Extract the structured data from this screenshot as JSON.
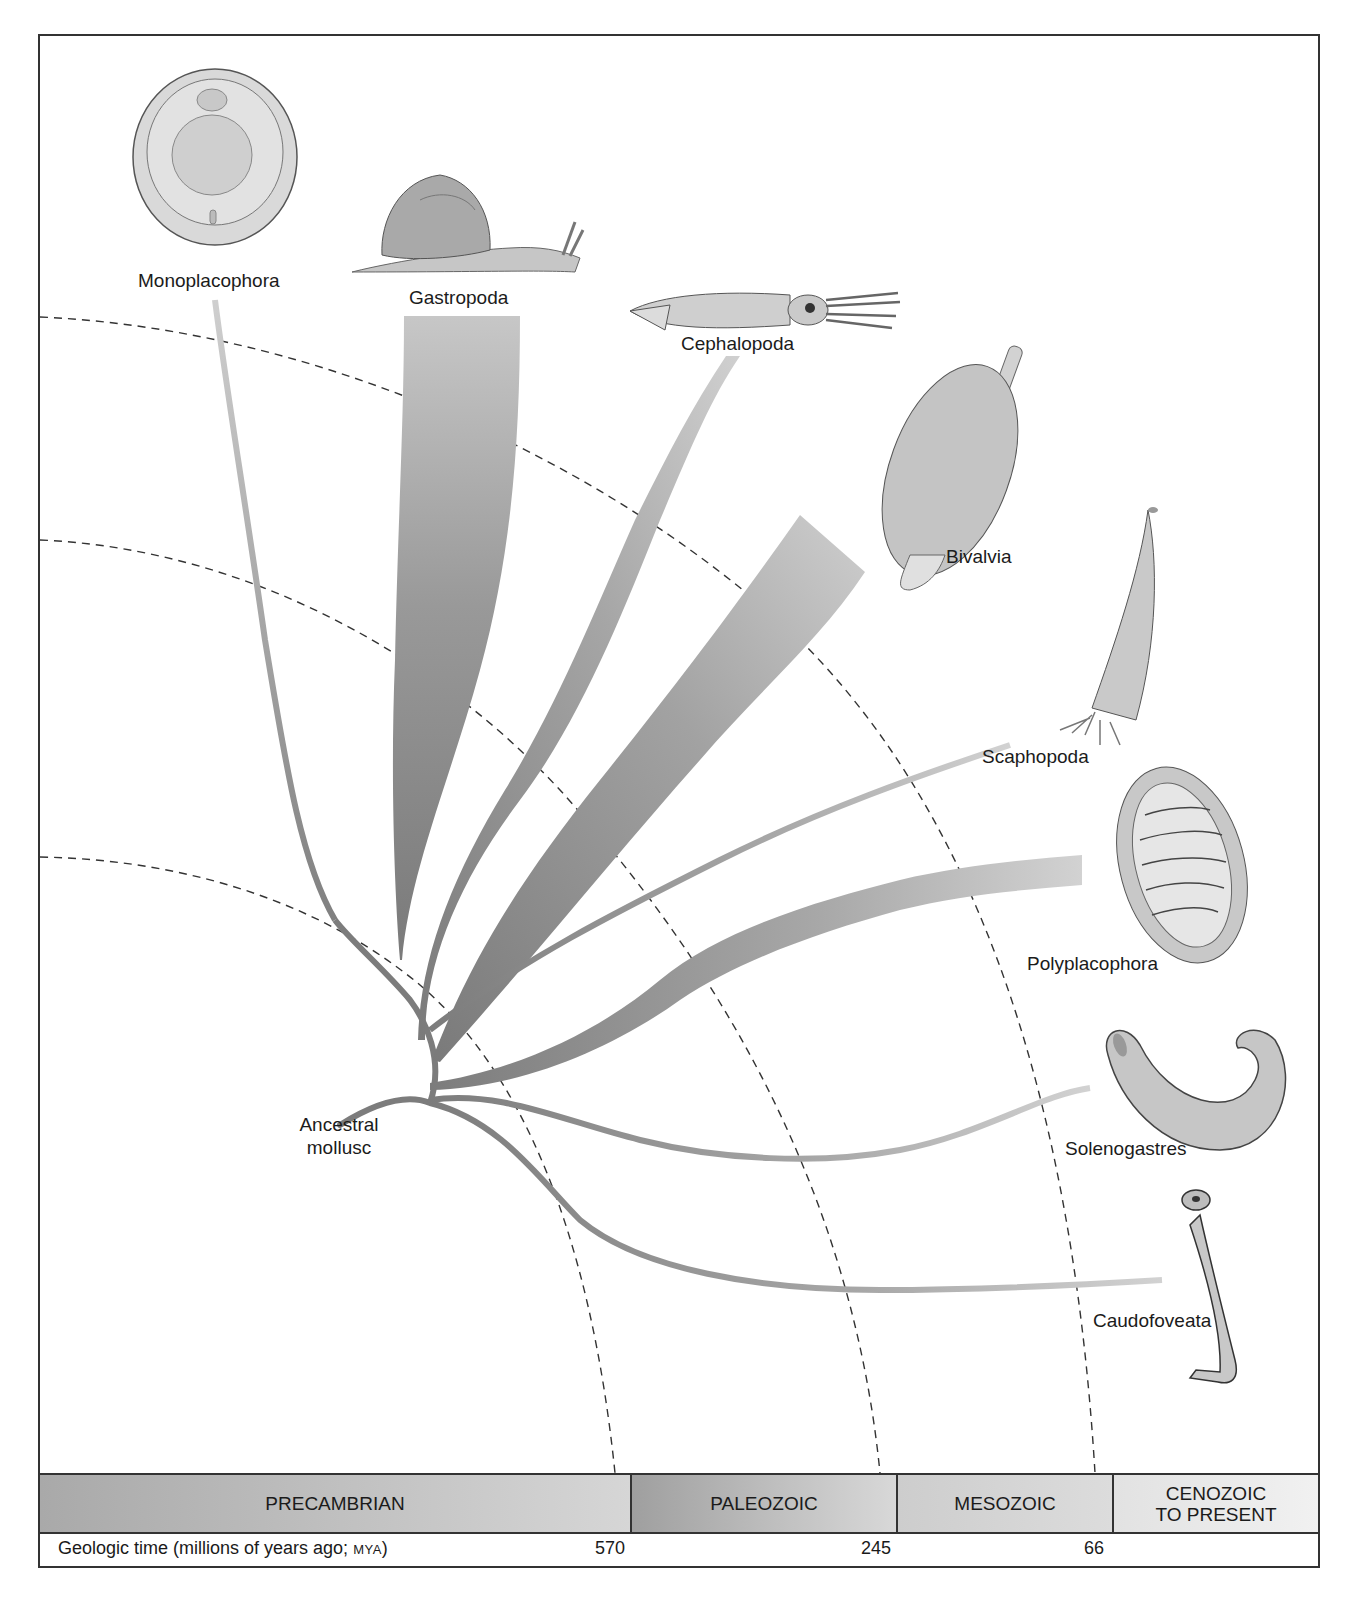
{
  "diagram": {
    "root_label_line1": "Ancestral",
    "root_label_line2": "mollusc",
    "taxa": [
      {
        "name": "Monoplacophora",
        "illustration": "monoplacophoran-limpet"
      },
      {
        "name": "Gastropoda",
        "illustration": "snail"
      },
      {
        "name": "Cephalopoda",
        "illustration": "squid"
      },
      {
        "name": "Bivalvia",
        "illustration": "clam"
      },
      {
        "name": "Scaphopoda",
        "illustration": "tusk-shell"
      },
      {
        "name": "Polyplacophora",
        "illustration": "chiton"
      },
      {
        "name": "Solenogastres",
        "illustration": "solenogaster-worm"
      },
      {
        "name": "Caudofoveata",
        "illustration": "caudofoveate-worm"
      }
    ],
    "eras": [
      {
        "name": "PRECAMBRIAN"
      },
      {
        "name": "PALEOZOIC"
      },
      {
        "name": "MESOZOIC"
      },
      {
        "name": "CENOZOIC",
        "name_line2": "TO PRESENT"
      }
    ],
    "timeline": {
      "caption": "Geologic time (millions of years ago; ",
      "caption_abbrev": "MYA",
      "caption_end": ")",
      "ticks": [
        "570",
        "245",
        "66"
      ]
    },
    "colors": {
      "branch_dark": "#7c7c7c",
      "branch_light": "#c8c8c8",
      "dashed_line": "#333333",
      "frame": "#333333"
    }
  }
}
